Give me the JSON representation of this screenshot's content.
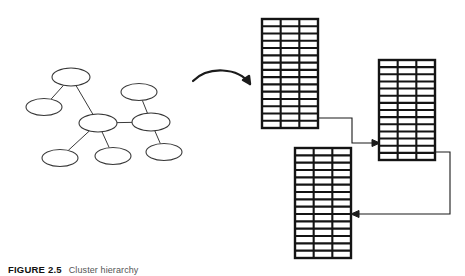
{
  "figure": {
    "label": "FIGURE 2.5",
    "caption": "Cluster hierarchy",
    "domain_note": "network graph transformed into linked relational tables"
  },
  "diagram": {
    "title": "",
    "stroke_color": "#1b1b1b",
    "table_border_color": "#141414",
    "node_stroke_color": "#3a3a3a",
    "background": "#ffffff",
    "graph": {
      "name": "network-graph",
      "node_rx": 18,
      "node_ry": 8.5,
      "nodes": [
        {
          "id": "n1",
          "cx": 71,
          "cy": 77,
          "rx": 19,
          "ry": 9
        },
        {
          "id": "n2",
          "cx": 44,
          "cy": 107,
          "rx": 18,
          "ry": 8.5
        },
        {
          "id": "n3",
          "cx": 98,
          "cy": 123,
          "rx": 19,
          "ry": 9
        },
        {
          "id": "n4",
          "cx": 60,
          "cy": 158,
          "rx": 18,
          "ry": 8.5
        },
        {
          "id": "n5",
          "cx": 113,
          "cy": 156,
          "rx": 18,
          "ry": 8.5
        },
        {
          "id": "n6",
          "cx": 151,
          "cy": 122,
          "rx": 19,
          "ry": 9
        },
        {
          "id": "n7",
          "cx": 139,
          "cy": 92,
          "rx": 18,
          "ry": 8.5
        },
        {
          "id": "n8",
          "cx": 164,
          "cy": 152,
          "rx": 18,
          "ry": 8.5
        }
      ],
      "edges": [
        {
          "from": "n1",
          "to": "n2"
        },
        {
          "from": "n1",
          "to": "n3"
        },
        {
          "from": "n3",
          "to": "n4"
        },
        {
          "from": "n3",
          "to": "n5"
        },
        {
          "from": "n3",
          "to": "n6"
        },
        {
          "from": "n6",
          "to": "n7"
        },
        {
          "from": "n6",
          "to": "n8"
        }
      ]
    },
    "transform_arrow": {
      "name": "curved-transform-arrow",
      "path": "M 193 81 C 208 66, 238 67, 250 84",
      "head": "M 250 84 L 243 80 L 249 76 Z"
    },
    "tables": [
      {
        "id": "table-1",
        "x": 262,
        "y": 19,
        "w": 56,
        "h": 109,
        "columns": 3,
        "rows": 15
      },
      {
        "id": "table-2",
        "x": 379,
        "y": 60,
        "w": 56,
        "h": 100,
        "columns": 3,
        "rows": 14
      },
      {
        "id": "table-3",
        "x": 295,
        "y": 148,
        "w": 56,
        "h": 110,
        "columns": 3,
        "rows": 15
      }
    ],
    "connectors": [
      {
        "id": "connector-1-to-2",
        "from_table": "table-1",
        "to_table": "table-2",
        "path": "M 318 118 L 352 118 L 352 143 L 378 143",
        "head": "M 380 143 L 372 139.5 L 372 146.5 Z"
      },
      {
        "id": "connector-2-to-3",
        "from_table": "table-2",
        "to_table": "table-3",
        "path": "M 435 152 L 450 152 L 450 214 L 353 214",
        "head": "M 351 214 L 359 210.5 L 359 217.5 Z"
      }
    ]
  }
}
